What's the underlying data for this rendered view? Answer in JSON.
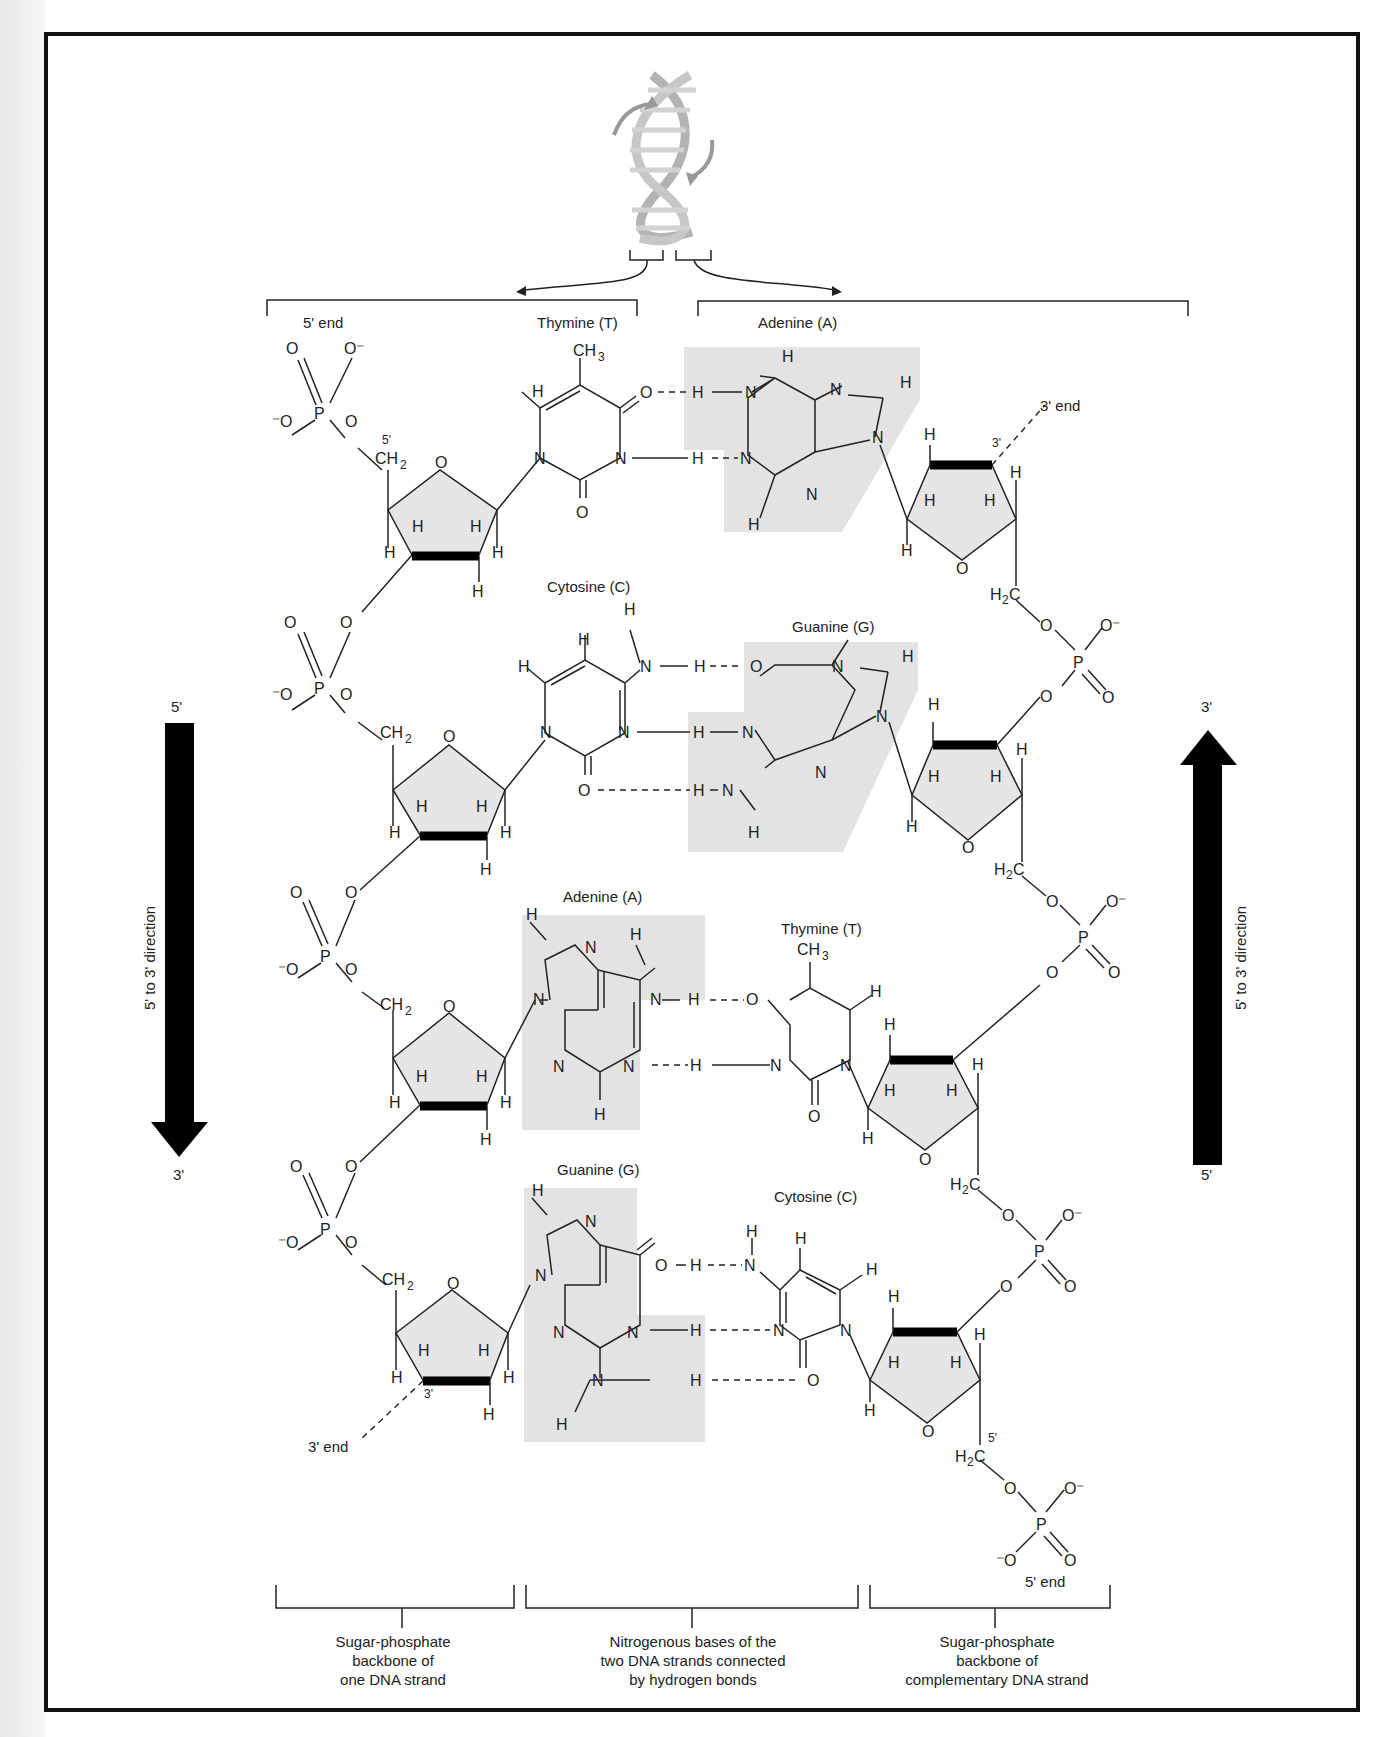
{
  "figure": {
    "type": "DNA double helix chemical structure diagram",
    "top_labels": {
      "left_strand_start": "5' end",
      "left_strand_end_right_side": "3' end",
      "right_strand_end_bottom": "5' end",
      "left_bottom_end": "3' end"
    },
    "base_pairs": [
      {
        "left": "Thymine (T)",
        "right": "Adenine (A)"
      },
      {
        "left": "Cytosine (C)",
        "right": "Guanine (G)"
      },
      {
        "left": "Adenine (A)",
        "right": "Thymine (T)"
      },
      {
        "left": "Guanine (G)",
        "right": "Cytosine (C)"
      }
    ],
    "left_arrow": {
      "top": "5'",
      "bottom": "3'",
      "label": "5' to 3' direction"
    },
    "right_arrow": {
      "top": "3'",
      "bottom": "5'",
      "label": "5' to 3' direction"
    },
    "captions": [
      "Sugar-phosphate backbone of one DNA strand",
      "Nitrogenous bases of the two DNA strands connected by hydrogen bonds",
      "Sugar-phosphate backbone of complementary DNA strand"
    ],
    "caption_lines": {
      "left": [
        "Sugar-phosphate",
        "backbone of",
        "one DNA strand"
      ],
      "middle": [
        "Nitrogenous bases of the",
        "two DNA strands connected",
        "by hydrogen bonds"
      ],
      "right": [
        "Sugar-phosphate",
        "backbone of",
        "complementary DNA strand"
      ]
    },
    "atoms": {
      "P": "P",
      "O": "O",
      "Ominus": "O⁻",
      "minusO": "⁻O",
      "N": "N",
      "H": "H",
      "CH2": "CH",
      "sub2": "2",
      "CH3": "CH",
      "sub3": "3",
      "H2C": "H",
      "C": "C",
      "prime5": "5'",
      "prime3": "3'"
    }
  }
}
